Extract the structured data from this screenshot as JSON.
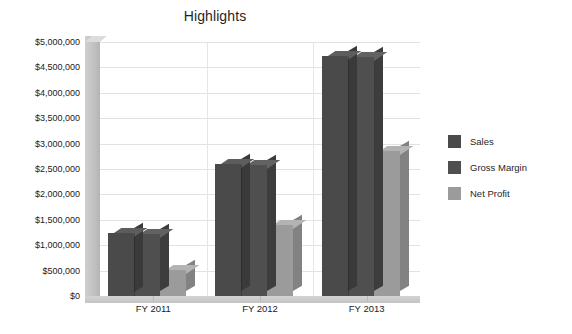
{
  "chart_data": {
    "type": "bar",
    "title": "Highlights",
    "xlabel": "",
    "ylabel": "",
    "categories": [
      "FY 2011",
      "FY 2012",
      "FY 2013"
    ],
    "series": [
      {
        "name": "Sales",
        "values": [
          1250000,
          2600000,
          4720000
        ],
        "color": "#4a4a4a"
      },
      {
        "name": "Gross Margin",
        "values": [
          1220000,
          2580000,
          4700000
        ],
        "color": "#4f4f4f"
      },
      {
        "name": "Net Profit",
        "values": [
          520000,
          1400000,
          2850000
        ],
        "color": "#9b9b9b"
      }
    ],
    "ylim": [
      0,
      5000000
    ],
    "ytick_step": 500000,
    "ytick_labels": [
      "$5,000,000",
      "$4,500,000",
      "$4,000,000",
      "$3,500,000",
      "$3,000,000",
      "$2,500,000",
      "$2,000,000",
      "$1,500,000",
      "$1,000,000",
      "$500,000",
      "$0"
    ],
    "ytick_values": [
      5000000,
      4500000,
      4000000,
      3500000,
      3000000,
      2500000,
      2000000,
      1500000,
      1000000,
      500000,
      0
    ],
    "grid": true,
    "legend_position": "right",
    "style": "3d-column",
    "plot_background": "#ffffff",
    "gridline_color": "#e2e2e2",
    "wall_color": "#c4c4c4"
  }
}
